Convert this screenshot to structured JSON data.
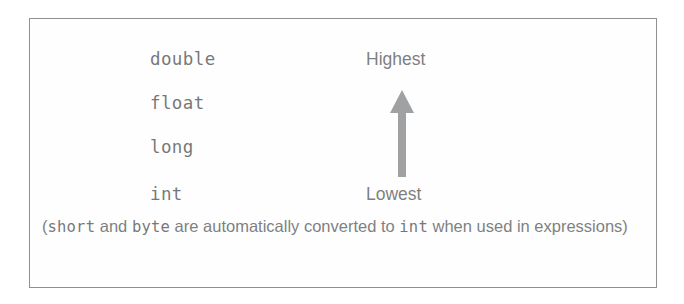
{
  "diagram": {
    "type_ladder": {
      "rows": [
        {
          "name": "double"
        },
        {
          "name": "float"
        },
        {
          "name": "long"
        },
        {
          "name": "int"
        }
      ]
    },
    "rank_scale": {
      "top_label": "Highest",
      "bottom_label": "Lowest",
      "arrow_direction": "up",
      "arrow_color": "#6e7072"
    },
    "caption": {
      "segment_1": "(",
      "mono_1": "short",
      "segment_2": " and ",
      "mono_2": "byte",
      "segment_3": " are automatically converted to ",
      "mono_3": "int",
      "segment_4": " when used in expressions)"
    }
  },
  "colors": {
    "border": "#8e9092",
    "mono_text": "#2f3133",
    "prose_text": "#3a3c3e",
    "arrow": "#6e7072",
    "background": "#ffffff"
  }
}
